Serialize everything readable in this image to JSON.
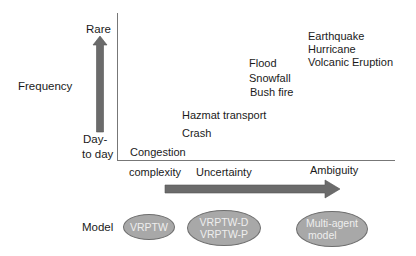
{
  "y_axis": {
    "title": "Frequency",
    "top_label": "Rare",
    "bottom_label_line1": "Day-",
    "bottom_label_line2": "to day"
  },
  "x_axis": {
    "labels": [
      "complexity",
      "Uncertainty",
      "Ambiguity"
    ]
  },
  "events": {
    "congestion": "Congestion",
    "crash": "Crash",
    "hazmat": "Hazmat transport",
    "flood": "Flood",
    "snowfall": "Snowfall",
    "bushfire": "Bush fire",
    "earthquake": "Earthquake",
    "hurricane": "Hurricane",
    "volcanic": "Volcanic Eruption"
  },
  "models": {
    "row_label": "Model",
    "items": [
      {
        "line1": "VRPTW",
        "line2": ""
      },
      {
        "line1": "VRPTW-D",
        "line2": "VRPTW-P"
      },
      {
        "line1": "Multi-agent",
        "line2": "model"
      }
    ]
  },
  "colors": {
    "arrow": "#6b6b6b",
    "ellipse_fill": "#a8a8a8",
    "axis": "#777777"
  }
}
